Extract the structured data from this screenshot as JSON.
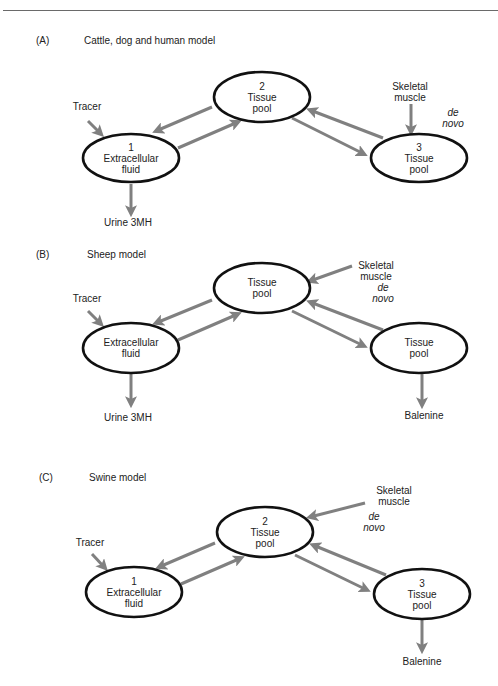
{
  "figure": {
    "colors": {
      "ellipse_stroke": "#111111",
      "arrow": "#808080",
      "text": "#222222",
      "rule": "#6a6a6a"
    },
    "panels": [
      {
        "id": "A",
        "letter": "(A)",
        "title": "Cattle, dog and human model",
        "letter_pos": [
          36,
          44
        ],
        "title_pos": [
          84,
          44
        ],
        "nodes": [
          {
            "id": "1",
            "cx": 131,
            "cy": 158,
            "rx": 48,
            "ry": 24,
            "lines": [
              "1",
              "Extracellular",
              "fluid"
            ]
          },
          {
            "id": "2",
            "cx": 262,
            "cy": 97,
            "rx": 48,
            "ry": 25,
            "lines": [
              "2",
              "Tissue",
              "pool"
            ]
          },
          {
            "id": "3",
            "cx": 419,
            "cy": 158,
            "rx": 48,
            "ry": 24,
            "lines": [
              "3",
              "Tissue",
              "pool"
            ]
          }
        ],
        "arrows": [
          {
            "from": [
              88,
              121
            ],
            "to": [
              101,
              134
            ],
            "label": "tracer-in"
          },
          {
            "from": [
              212,
              107
            ],
            "to": [
              156,
              131
            ],
            "label": "2-to-1"
          },
          {
            "from": [
              178,
              148
            ],
            "to": [
              238,
              122
            ],
            "label": "1-to-2"
          },
          {
            "from": [
              292,
              118
            ],
            "to": [
              364,
              154
            ],
            "label": "2-to-3"
          },
          {
            "from": [
              383,
              138
            ],
            "to": [
              310,
              110
            ],
            "label": "3-to-2"
          },
          {
            "from": [
              411,
              104
            ],
            "to": [
              411,
              132
            ],
            "label": "muscle-in"
          },
          {
            "from": [
              131,
              184
            ],
            "to": [
              131,
              213
            ],
            "label": "urine-out"
          }
        ],
        "labels": [
          {
            "text": "Tracer",
            "x": 87,
            "y": 110,
            "italic": false
          },
          {
            "text": "Skeletal",
            "x": 410,
            "y": 90,
            "italic": false
          },
          {
            "text": "muscle",
            "x": 410,
            "y": 101,
            "italic": false
          },
          {
            "text": "de",
            "x": 453,
            "y": 116,
            "italic": true
          },
          {
            "text": "novo",
            "x": 453,
            "y": 127,
            "italic": true
          },
          {
            "text": "Urine 3MH",
            "x": 128,
            "y": 226,
            "italic": false
          }
        ]
      },
      {
        "id": "B",
        "letter": "(B)",
        "title": "Sheep model",
        "letter_pos": [
          36,
          258
        ],
        "title_pos": [
          87,
          258
        ],
        "nodes": [
          {
            "id": "1",
            "cx": 131,
            "cy": 348,
            "rx": 48,
            "ry": 25,
            "lines": [
              "Extracellular",
              "fluid"
            ]
          },
          {
            "id": "2",
            "cx": 262,
            "cy": 288,
            "rx": 48,
            "ry": 25,
            "lines": [
              "Tissue",
              "pool"
            ]
          },
          {
            "id": "3",
            "cx": 419,
            "cy": 348,
            "rx": 48,
            "ry": 25,
            "lines": [
              "Tissue",
              "pool"
            ]
          }
        ],
        "arrows": [
          {
            "from": [
              88,
              311
            ],
            "to": [
              101,
              324
            ],
            "label": "tracer-in"
          },
          {
            "from": [
              212,
              300
            ],
            "to": [
              156,
              323
            ],
            "label": "2-to-1"
          },
          {
            "from": [
              178,
              340
            ],
            "to": [
              238,
              314
            ],
            "label": "1-to-2"
          },
          {
            "from": [
              292,
              311
            ],
            "to": [
              364,
              346
            ],
            "label": "2-to-3"
          },
          {
            "from": [
              383,
              330
            ],
            "to": [
              310,
              302
            ],
            "label": "3-to-2"
          },
          {
            "from": [
              352,
              266
            ],
            "to": [
              310,
              281
            ],
            "label": "muscle-in"
          },
          {
            "from": [
              131,
              374
            ],
            "to": [
              131,
              404
            ],
            "label": "urine-out"
          },
          {
            "from": [
              422,
              374
            ],
            "to": [
              422,
              405
            ],
            "label": "balenine-out"
          }
        ],
        "labels": [
          {
            "text": "Tracer",
            "x": 87,
            "y": 302,
            "italic": false
          },
          {
            "text": "Skeletal",
            "x": 376,
            "y": 269,
            "italic": false
          },
          {
            "text": "muscle",
            "x": 376,
            "y": 280,
            "italic": false
          },
          {
            "text": "de",
            "x": 383,
            "y": 291,
            "italic": true
          },
          {
            "text": "novo",
            "x": 383,
            "y": 302,
            "italic": true
          },
          {
            "text": "Urine 3MH",
            "x": 128,
            "y": 421,
            "italic": false
          },
          {
            "text": "Balenine",
            "x": 424,
            "y": 419,
            "italic": false
          }
        ]
      },
      {
        "id": "C",
        "letter": "(C)",
        "title": "Swine model",
        "letter_pos": [
          39,
          481
        ],
        "title_pos": [
          89,
          481
        ],
        "nodes": [
          {
            "id": "1",
            "cx": 134,
            "cy": 592,
            "rx": 48,
            "ry": 25,
            "lines": [
              "1",
              "Extracellular",
              "fluid"
            ]
          },
          {
            "id": "2",
            "cx": 265,
            "cy": 532,
            "rx": 48,
            "ry": 25,
            "lines": [
              "2",
              "Tissue",
              "pool"
            ]
          },
          {
            "id": "3",
            "cx": 422,
            "cy": 594,
            "rx": 48,
            "ry": 25,
            "lines": [
              "3",
              "Tissue",
              "pool"
            ]
          }
        ],
        "arrows": [
          {
            "from": [
              92,
              554
            ],
            "to": [
              105,
              568
            ],
            "label": "tracer-in"
          },
          {
            "from": [
              215,
              543
            ],
            "to": [
              159,
              567
            ],
            "label": "2-to-1"
          },
          {
            "from": [
              181,
              584
            ],
            "to": [
              241,
              558
            ],
            "label": "1-to-2"
          },
          {
            "from": [
              295,
              555
            ],
            "to": [
              367,
              590
            ],
            "label": "2-to-3"
          },
          {
            "from": [
              386,
              575
            ],
            "to": [
              313,
              545
            ],
            "label": "3-to-2"
          },
          {
            "from": [
              365,
              503
            ],
            "to": [
              310,
              517
            ],
            "label": "muscle-in"
          },
          {
            "from": [
              422,
              620
            ],
            "to": [
              422,
              650
            ],
            "label": "balenine-out"
          }
        ],
        "labels": [
          {
            "text": "Tracer",
            "x": 90,
            "y": 546,
            "italic": false
          },
          {
            "text": "Skeletal",
            "x": 394,
            "y": 494,
            "italic": false
          },
          {
            "text": "muscle",
            "x": 394,
            "y": 505,
            "italic": false
          },
          {
            "text": "de",
            "x": 374,
            "y": 520,
            "italic": true
          },
          {
            "text": "novo",
            "x": 374,
            "y": 531,
            "italic": true
          },
          {
            "text": "Balenine",
            "x": 422,
            "y": 665,
            "italic": false
          }
        ]
      }
    ]
  }
}
